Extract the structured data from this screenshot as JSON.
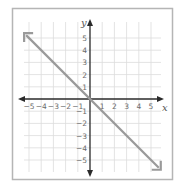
{
  "chart_data": {
    "type": "line",
    "title": "",
    "xlabel": "x",
    "ylabel": "y",
    "xlim": [
      -5.5,
      5.5
    ],
    "ylim": [
      -5.5,
      5.5
    ],
    "grid": true,
    "x_ticks": [
      -5,
      -4,
      -3,
      -2,
      -1,
      1,
      2,
      3,
      4,
      5
    ],
    "y_ticks": [
      5,
      4,
      3,
      2,
      1,
      -1,
      -2,
      -3,
      -4,
      -5
    ],
    "x_tick_labels": [
      "−5",
      "−4",
      "−3",
      "−2",
      "−1",
      "1",
      "2",
      "3",
      "4",
      "5"
    ],
    "y_tick_labels": [
      "5",
      "4",
      "3",
      "2",
      "1",
      "−1",
      "−2",
      "−3",
      "−4",
      "−5"
    ],
    "series": [
      {
        "name": "y = -x",
        "equation": "y = -x",
        "slope": -1,
        "intercept": 0,
        "x": [
          -5.4,
          0,
          5.8
        ],
        "y": [
          5.4,
          0,
          -5.8
        ],
        "arrows_both_ends": true,
        "color": "#9a9a9a"
      }
    ],
    "legend": null
  },
  "style": {
    "frame_color": "#b5b5b5",
    "grid_color": "#dcdcdc",
    "axis_color": "#2a2a2a",
    "line_color": "#9a9a9a"
  }
}
